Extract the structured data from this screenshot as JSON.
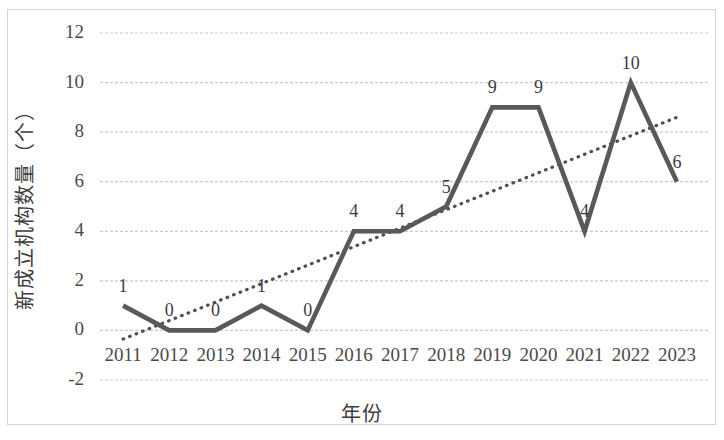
{
  "chart_data": {
    "type": "line",
    "title": "",
    "xlabel": "年份",
    "ylabel": "新成立机构数量（个）",
    "categories": [
      "2011",
      "2012",
      "2013",
      "2014",
      "2015",
      "2016",
      "2017",
      "2018",
      "2019",
      "2020",
      "2021",
      "2022",
      "2023"
    ],
    "values": [
      1,
      0,
      0,
      1,
      0,
      4,
      4,
      5,
      9,
      9,
      4,
      10,
      6
    ],
    "data_labels": [
      "1",
      "0",
      "0",
      "1",
      "0",
      "4",
      "4",
      "5",
      "9",
      "9",
      "4",
      "10",
      "6"
    ],
    "ylim": [
      -2,
      12
    ],
    "yticks": [
      "12",
      "10",
      "8",
      "6",
      "4",
      "2",
      "0",
      "-2"
    ],
    "ytick_values": [
      12,
      10,
      8,
      6,
      4,
      2,
      0,
      -2
    ],
    "grid": true,
    "grid_style": "dotted-horizontal",
    "legend": "none",
    "series": [
      {
        "name": "新成立机构数量",
        "style": "solid",
        "color": "#595959",
        "values": [
          1,
          0,
          0,
          1,
          0,
          4,
          4,
          5,
          9,
          9,
          4,
          10,
          6
        ]
      },
      {
        "name": "趋势线",
        "style": "dotted",
        "color": "#4f4f4f",
        "trendline": true,
        "start_value": -0.35,
        "end_value": 8.6
      }
    ]
  },
  "colors": {
    "line": "#595959",
    "trendline": "#4f4f4f",
    "grid": "#c9c9c9",
    "border": "#d4d4d4",
    "text": "#3d3d3d",
    "background": "#ffffff"
  }
}
